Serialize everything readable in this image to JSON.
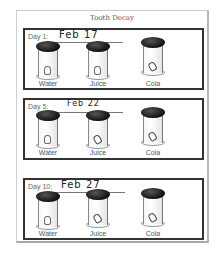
{
  "worksheet": {
    "title": "Tooth Decay",
    "panels": [
      {
        "day_label": "Day 1:",
        "date": "Feb 17",
        "cups": [
          {
            "label": "Water",
            "tooth_state": "clean"
          },
          {
            "label": "Juice",
            "tooth_state": "clean"
          },
          {
            "label": "Cola",
            "tooth_state": "stained"
          }
        ]
      },
      {
        "day_label": "Day 5:",
        "date": "Feb 22",
        "cups": [
          {
            "label": "Water",
            "tooth_state": "clean"
          },
          {
            "label": "Juice",
            "tooth_state": "stained"
          },
          {
            "label": "Cola",
            "tooth_state": "stained"
          }
        ]
      },
      {
        "day_label": "Day 10:",
        "date": "Feb 27",
        "cups": [
          {
            "label": "Water",
            "tooth_state": "clean"
          },
          {
            "label": "Juice",
            "tooth_state": "stained"
          },
          {
            "label": "Cola",
            "tooth_state": "stained"
          }
        ]
      }
    ]
  },
  "colors": {
    "frame": "#333333",
    "lid": "#1a1a1a",
    "paper": "#ffffff"
  }
}
